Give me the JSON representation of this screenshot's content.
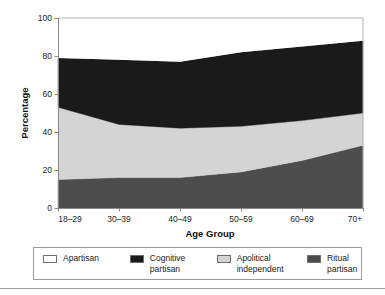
{
  "chart_data": {
    "type": "area",
    "title": "",
    "subtitle": "",
    "xlabel": "Age Group",
    "ylabel": "Percentage",
    "categories": [
      "18–29",
      "30–39",
      "40–49",
      "50–59",
      "60–69",
      "70+"
    ],
    "ylim": [
      0,
      100
    ],
    "yticks": [
      0,
      20,
      40,
      60,
      80,
      100
    ],
    "ytick_labels": [
      "0",
      "20",
      "40",
      "60",
      "80",
      "100"
    ],
    "grid": false,
    "legend_position": "bottom",
    "stacked": true,
    "stack_order_bottom_to_top": [
      "Ritual partisan",
      "Apolitical independent",
      "Cognitive partisan",
      "Apartisan"
    ],
    "series": [
      {
        "name": "Ritual partisan",
        "color": "#4d4d4d",
        "values": [
          15,
          16,
          16,
          19,
          25,
          33
        ]
      },
      {
        "name": "Apolitical independent",
        "color": "#d4d4d4",
        "values": [
          38,
          28,
          26,
          24,
          21,
          17
        ]
      },
      {
        "name": "Cognitive partisan",
        "color": "#1a1a1a",
        "values": [
          26,
          34,
          35,
          39,
          39,
          38
        ]
      },
      {
        "name": "Apartisan",
        "color": "#ffffff",
        "values": [
          21,
          22,
          23,
          18,
          15,
          12
        ]
      }
    ],
    "cumulative_tops": {
      "Ritual partisan": [
        15,
        16,
        16,
        19,
        25,
        33
      ],
      "Apolitical independent": [
        53,
        44,
        42,
        43,
        46,
        50
      ],
      "Cognitive partisan": [
        79,
        78,
        77,
        82,
        85,
        88
      ],
      "Apartisan": [
        100,
        100,
        100,
        100,
        100,
        100
      ]
    }
  },
  "axes": {
    "y_title": "Percentage",
    "x_title": "Age Group"
  },
  "legend": {
    "items": [
      {
        "label": "Apartisan",
        "color": "#ffffff"
      },
      {
        "label": "Cognitive partisan",
        "color": "#1a1a1a"
      },
      {
        "label": "Apolitical independent",
        "color": "#d4d4d4"
      },
      {
        "label": "Ritual partisan",
        "color": "#4d4d4d"
      }
    ]
  }
}
